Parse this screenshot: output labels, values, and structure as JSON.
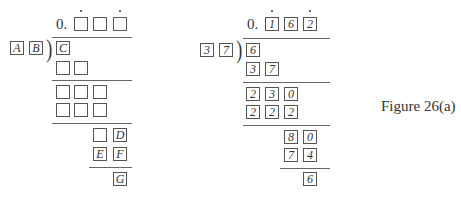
{
  "figure_caption": "Figure 26(a)",
  "left_diagram": {
    "quotient_prefix": "0.",
    "quotient_boxes": [
      "",
      "",
      ""
    ],
    "repeating_dots_over": [
      0,
      2
    ],
    "divisor": [
      "A",
      "B"
    ],
    "dividend": [
      "C"
    ],
    "row1": [
      "",
      ""
    ],
    "row2": [
      "",
      "",
      ""
    ],
    "row3": [
      "",
      "",
      ""
    ],
    "row4": [
      "",
      "D"
    ],
    "row5": [
      "E",
      "F"
    ],
    "remainder": [
      "G"
    ]
  },
  "right_diagram": {
    "quotient_prefix": "0.",
    "quotient_boxes": [
      "1",
      "6",
      "2"
    ],
    "repeating_dots_over": [
      0,
      2
    ],
    "divisor": [
      "3",
      "7"
    ],
    "dividend": [
      "6"
    ],
    "row1": [
      "3",
      "7"
    ],
    "row2": [
      "2",
      "3",
      "0"
    ],
    "row3": [
      "2",
      "2",
      "2"
    ],
    "row4": [
      "8",
      "0"
    ],
    "row5": [
      "7",
      "4"
    ],
    "remainder": [
      "6"
    ]
  }
}
